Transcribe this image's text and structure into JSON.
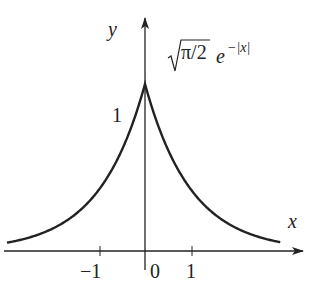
{
  "chart_data": {
    "type": "line",
    "title": "",
    "annotation": "√(π/2) e^(−|x|)",
    "xlabel": "x",
    "ylabel": "y",
    "x_ticks": [
      -1,
      0,
      1
    ],
    "x_tick_labels": [
      "−1",
      "0",
      "1"
    ],
    "y_ticks": [
      1
    ],
    "y_tick_labels": [
      "1"
    ],
    "xlim": [
      -3.1,
      3.5
    ],
    "ylim": [
      0,
      1.3
    ],
    "grid": false,
    "legend": null,
    "series": [
      {
        "name": "√(π/2) e^(−|x|)",
        "x": [
          -3,
          -2.5,
          -2,
          -1.5,
          -1,
          -0.5,
          0,
          0.5,
          1,
          1.5,
          2,
          2.5,
          3
        ],
        "values": [
          0.0624,
          0.1029,
          0.1696,
          0.2797,
          0.4611,
          0.7602,
          1.2533,
          0.7602,
          0.4611,
          0.2797,
          0.1696,
          0.1029,
          0.0624
        ]
      }
    ]
  },
  "labels": {
    "y_axis": "y",
    "x_axis": "x",
    "tick_neg1": "−1",
    "tick_0": "0",
    "tick_1": "1",
    "y_tick_1": "1",
    "formula_coef": "π/2",
    "formula_e": "e",
    "formula_exp": "−|x|"
  }
}
